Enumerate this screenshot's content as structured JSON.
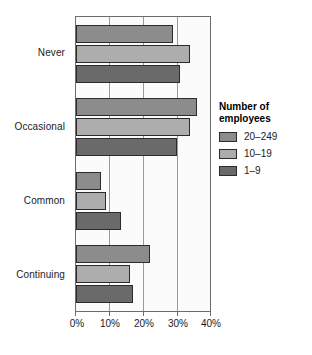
{
  "chart_data": {
    "type": "bar",
    "orientation": "horizontal",
    "title": "",
    "xlabel": "",
    "ylabel": "",
    "categories": [
      "Never",
      "Occasional",
      "Common",
      "Continuing"
    ],
    "series": [
      {
        "name": "20–249",
        "color": "#8c8c8c",
        "values": [
          29,
          36,
          7.5,
          22
        ]
      },
      {
        "name": "10–19",
        "color": "#adadad",
        "values": [
          34,
          34,
          9,
          16
        ]
      },
      {
        "name": "1–9",
        "color": "#6a6a6a",
        "values": [
          31,
          30,
          13.5,
          17
        ]
      }
    ],
    "xlim": [
      0,
      40
    ],
    "xticks": [
      0,
      10,
      20,
      30,
      40
    ],
    "xtick_labels": [
      "0%",
      "10%",
      "20%",
      "30%",
      "40%"
    ],
    "grid": true,
    "grid_axis": "x",
    "legend_position": "right"
  },
  "legend": {
    "title_line1": "Number of",
    "title_line2": "employees",
    "entries": [
      {
        "label": "20–249",
        "color": "#8c8c8c"
      },
      {
        "label": "10–19",
        "color": "#adadad"
      },
      {
        "label": "1–9",
        "color": "#6a6a6a"
      }
    ]
  },
  "axes": {
    "y_categories": [
      "Never",
      "Occasional",
      "Common",
      "Continuing"
    ],
    "x_tick_labels": [
      "0%",
      "10%",
      "20%",
      "30%",
      "40%"
    ]
  }
}
